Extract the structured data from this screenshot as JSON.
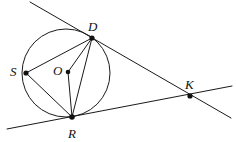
{
  "figure": {
    "type": "geometry-diagram",
    "background_color": "#ffffff",
    "stroke_color": "#1a1a1a",
    "label_color": "#111111",
    "labels": {
      "D": "D",
      "S": "S",
      "O": "O",
      "R": "R",
      "K": "K"
    },
    "points": {
      "D": {
        "name": "D",
        "x": 92,
        "y": 38,
        "label_x": 88,
        "label_y": 31
      },
      "S": {
        "name": "S",
        "x": 26,
        "y": 73,
        "label_x": 10,
        "label_y": 76
      },
      "O": {
        "name": "O",
        "x": 68,
        "y": 72,
        "label_x": 53,
        "label_y": 75
      },
      "R": {
        "name": "R",
        "x": 72,
        "y": 117,
        "label_x": 68,
        "label_y": 138
      },
      "K": {
        "name": "K",
        "x": 190,
        "y": 96,
        "label_x": 185,
        "label_y": 89
      }
    },
    "circle": {
      "cx": 66,
      "cy": 73,
      "r": 44
    },
    "segments": [
      {
        "name": "segment-S-D",
        "from": "S",
        "to": "D",
        "x1": 26,
        "y1": 73,
        "x2": 92,
        "y2": 38
      },
      {
        "name": "segment-S-R",
        "from": "S",
        "to": "R",
        "x1": 26,
        "y1": 73,
        "x2": 72,
        "y2": 117
      },
      {
        "name": "segment-D-R",
        "from": "D",
        "to": "R",
        "x1": 92,
        "y1": 38,
        "x2": 72,
        "y2": 117
      },
      {
        "name": "segment-O-D",
        "from": "O",
        "to": "D",
        "x1": 68,
        "y1": 72,
        "x2": 92,
        "y2": 38
      },
      {
        "name": "segment-O-R",
        "from": "O",
        "to": "R",
        "x1": 68,
        "y1": 72,
        "x2": 72,
        "y2": 117
      }
    ],
    "lines": [
      {
        "name": "line-through-D-and-K",
        "x1": 30,
        "y1": 2,
        "x2": 231,
        "y2": 118
      },
      {
        "name": "line-through-R-and-K",
        "x1": 7,
        "y1": 129,
        "x2": 232,
        "y2": 86
      }
    ]
  }
}
